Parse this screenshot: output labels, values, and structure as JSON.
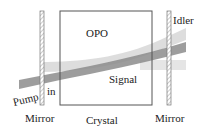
{
  "diagram": {
    "title": "OPO",
    "labels": {
      "pump": "Pump",
      "in": "in",
      "idler": "Idler",
      "signal": "Signal",
      "crystal": "Crystal",
      "mirror_left": "Mirror",
      "mirror_right": "Mirror"
    },
    "colors": {
      "pump_beam": "#8a8a8a",
      "signal_beam": "#c8c8c8",
      "idler_beam": "#d8d8d8",
      "outline": "#555555",
      "mirror_hatch": "#888888"
    }
  }
}
